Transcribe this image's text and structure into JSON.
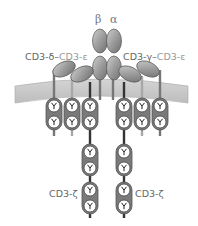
{
  "diagram": {
    "chains": {
      "beta": "β",
      "alpha": "α"
    },
    "labels": {
      "left_complex": {
        "first": "CD3-δ",
        "dash": "–",
        "second": "CD3-ε"
      },
      "right_complex": {
        "first": "CD3-γ",
        "dash": "–",
        "second": "CD3-ε"
      },
      "zeta_left": "CD3-ζ",
      "zeta_right": "CD3-ζ"
    },
    "itam_glyph": "Y",
    "colors": {
      "ectodomain": "#9a9a9a",
      "membrane": "#c8c8c8",
      "stem_dark": "#333333",
      "stem_mid": "#777777",
      "stem_light": "#a8a8a8",
      "pod": "#7a7a7a",
      "label": "#666666",
      "label_light": "#999999"
    }
  }
}
